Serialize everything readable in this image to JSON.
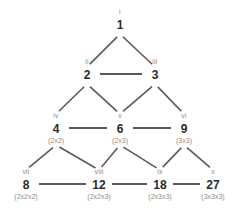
{
  "diagram": {
    "colors": {
      "background": "#ffffff",
      "node_value": "#2b2b2b",
      "node_label": "#8a8a8a",
      "node_factors": "#8c8c8c",
      "edge": "#5a5a5a"
    },
    "nodes": [
      {
        "id": "n1",
        "roman": "i",
        "value": "1",
        "factors": "",
        "x": 120,
        "y": 8
      },
      {
        "id": "n2",
        "roman": "ii",
        "value": "2",
        "factors": "",
        "x": 87,
        "y": 58
      },
      {
        "id": "n3",
        "roman": "iii",
        "value": "3",
        "factors": "",
        "x": 155,
        "y": 58
      },
      {
        "id": "n4",
        "roman": "iv",
        "value": "4",
        "factors": "(2x2)",
        "x": 56,
        "y": 112
      },
      {
        "id": "n6",
        "roman": "v",
        "value": "6",
        "factors": "(2x3)",
        "x": 120,
        "y": 112
      },
      {
        "id": "n9",
        "roman": "vi",
        "value": "9",
        "factors": "(3x3)",
        "x": 184,
        "y": 112
      },
      {
        "id": "n8",
        "roman": "vii",
        "value": "8",
        "factors": "(2x2x2)",
        "x": 26,
        "y": 168
      },
      {
        "id": "n12",
        "roman": "viii",
        "value": "12",
        "factors": "(2x2x3)",
        "x": 99,
        "y": 168
      },
      {
        "id": "n18",
        "roman": "ix",
        "value": "18",
        "factors": "(2x3x3)",
        "x": 160,
        "y": 168
      },
      {
        "id": "n27",
        "roman": "x",
        "value": "27",
        "factors": "(3x3x3)",
        "x": 213,
        "y": 168
      }
    ],
    "edges": [
      {
        "from": "n1",
        "to": "n2",
        "kind": "diagonal"
      },
      {
        "from": "n1",
        "to": "n3",
        "kind": "diagonal"
      },
      {
        "from": "n2",
        "to": "n3",
        "kind": "horizontal"
      },
      {
        "from": "n2",
        "to": "n4",
        "kind": "diagonal"
      },
      {
        "from": "n2",
        "to": "n6",
        "kind": "diagonal"
      },
      {
        "from": "n3",
        "to": "n6",
        "kind": "diagonal"
      },
      {
        "from": "n3",
        "to": "n9",
        "kind": "diagonal"
      },
      {
        "from": "n4",
        "to": "n6",
        "kind": "horizontal"
      },
      {
        "from": "n6",
        "to": "n9",
        "kind": "horizontal"
      },
      {
        "from": "n4",
        "to": "n8",
        "kind": "diagonal"
      },
      {
        "from": "n4",
        "to": "n12",
        "kind": "diagonal"
      },
      {
        "from": "n6",
        "to": "n12",
        "kind": "diagonal"
      },
      {
        "from": "n6",
        "to": "n18",
        "kind": "diagonal"
      },
      {
        "from": "n9",
        "to": "n18",
        "kind": "diagonal"
      },
      {
        "from": "n9",
        "to": "n27",
        "kind": "diagonal"
      },
      {
        "from": "n8",
        "to": "n12",
        "kind": "horizontal"
      },
      {
        "from": "n12",
        "to": "n18",
        "kind": "horizontal"
      },
      {
        "from": "n18",
        "to": "n27",
        "kind": "horizontal"
      }
    ]
  }
}
